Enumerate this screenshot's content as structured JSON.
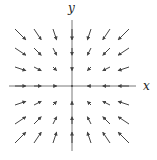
{
  "figure": {
    "type": "vector_field",
    "axes": {
      "x_label": "x",
      "y_label": "y"
    }
  },
  "chart_data": {
    "type": "vector_field",
    "title": "",
    "xlabel": "x",
    "ylabel": "y",
    "field": "F(x,y) = (-x, -y)",
    "grid_x": [
      -3,
      -2,
      -1,
      0,
      1,
      2,
      3
    ],
    "grid_y": [
      -3,
      -2,
      -1,
      0,
      1,
      2,
      3
    ],
    "behavior": "all vectors point toward the origin; magnitude grows with distance from origin",
    "grid": false
  },
  "style": {
    "axis_color": "#555555",
    "arrow_color": "#444444"
  }
}
